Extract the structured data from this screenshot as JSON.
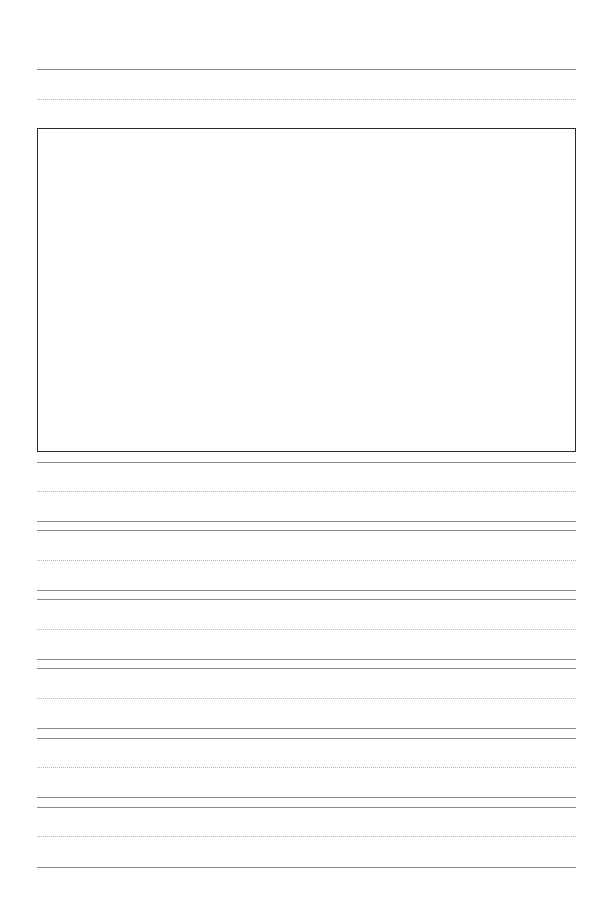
{
  "worksheet": {
    "type": "handwriting-practice-page",
    "colors": {
      "solid_line": "#8a8a8a",
      "dotted_line": "#b4b4b4",
      "box_border": "#2a2a2a",
      "background": "#ffffff"
    },
    "title_area": {
      "lines": [
        "solid",
        "dotted"
      ]
    },
    "picture_box": {
      "label": ""
    },
    "writing_rows": 6
  }
}
